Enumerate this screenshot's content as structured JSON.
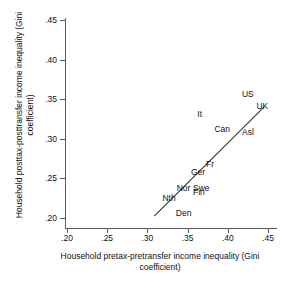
{
  "chart_data": {
    "type": "scatter",
    "title": "",
    "xlabel": "Household pretax-pretransfer income inequality (Gini coefficient)",
    "ylabel": "Household posttax-posttransfer income inequality (Gini coefficient)",
    "xlim": [
      0.2,
      0.45
    ],
    "ylim": [
      0.2,
      0.45
    ],
    "xticks": [
      ".20",
      ".25",
      ".30",
      ".35",
      ".40",
      ".45"
    ],
    "yticks": [
      ".20",
      ".25",
      ".30",
      ".35",
      ".40",
      ".45"
    ],
    "xtick_values": [
      0.2,
      0.25,
      0.3,
      0.35,
      0.4,
      0.45
    ],
    "ytick_values": [
      0.2,
      0.25,
      0.3,
      0.35,
      0.4,
      0.45
    ],
    "grid": false,
    "legend": "none",
    "point_style": "text-label",
    "points": [
      {
        "label": "US",
        "x": 0.425,
        "y": 0.357
      },
      {
        "label": "UK",
        "x": 0.443,
        "y": 0.342
      },
      {
        "label": "It",
        "x": 0.365,
        "y": 0.331
      },
      {
        "label": "Can",
        "x": 0.393,
        "y": 0.312
      },
      {
        "label": "Asl",
        "x": 0.425,
        "y": 0.308
      },
      {
        "label": "Fr",
        "x": 0.378,
        "y": 0.268
      },
      {
        "label": "Ger",
        "x": 0.363,
        "y": 0.258
      },
      {
        "label": "Nor",
        "x": 0.345,
        "y": 0.238
      },
      {
        "label": "Swe",
        "x": 0.367,
        "y": 0.238
      },
      {
        "label": "Fin",
        "x": 0.364,
        "y": 0.233
      },
      {
        "label": "Nth",
        "x": 0.327,
        "y": 0.225
      },
      {
        "label": "Den",
        "x": 0.345,
        "y": 0.206
      }
    ],
    "fit_line": {
      "type": "linear",
      "x_start": 0.3085,
      "y_start": 0.2025,
      "x_end": 0.4455,
      "y_end": 0.3405
    },
    "colors": {
      "axis": "#5a5a5a",
      "text": "#111111",
      "line": "#333333",
      "background": "#ffffff"
    }
  }
}
